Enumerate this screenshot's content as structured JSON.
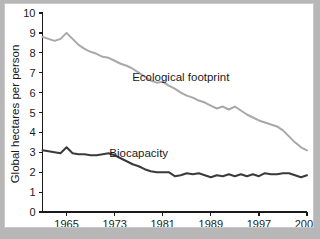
{
  "card": {
    "background_color": "#ffffff",
    "border_color": "#c9c9c9",
    "page_background_color": "#b7b7b7"
  },
  "chart_data": {
    "type": "line",
    "title": "",
    "subtitle": "",
    "xlabel": "",
    "ylabel": "Global hectares per person",
    "xlim": [
      1961,
      2005
    ],
    "ylim": [
      0,
      10
    ],
    "grid": false,
    "legend": "inline-annotation",
    "yticks": [
      0,
      1,
      2,
      3,
      4,
      5,
      6,
      7,
      8,
      9,
      10
    ],
    "ytick_labels": [
      "0",
      "1",
      "2",
      "3",
      "4",
      "5",
      "6",
      "7",
      "8",
      "9",
      "10"
    ],
    "xticks": [
      1965,
      1973,
      1981,
      1989,
      1997,
      2005
    ],
    "xtick_labels": [
      "1965",
      "1973",
      "1981",
      "1989",
      "1997",
      "2005"
    ],
    "x": [
      1961,
      1962,
      1963,
      1964,
      1965,
      1966,
      1967,
      1968,
      1969,
      1970,
      1971,
      1972,
      1973,
      1974,
      1975,
      1976,
      1977,
      1978,
      1979,
      1980,
      1981,
      1982,
      1983,
      1984,
      1985,
      1986,
      1987,
      1988,
      1989,
      1990,
      1991,
      1992,
      1993,
      1994,
      1995,
      1996,
      1997,
      1998,
      1999,
      2000,
      2001,
      2002,
      2003,
      2004,
      2005
    ],
    "series": [
      {
        "name": "Ecological footprint",
        "color": "#a8a8a8",
        "label_x": 1984,
        "label_y": 6.6,
        "values": [
          8.8,
          8.7,
          8.6,
          8.7,
          9.0,
          8.7,
          8.4,
          8.2,
          8.05,
          7.95,
          7.8,
          7.75,
          7.6,
          7.45,
          7.35,
          7.2,
          7.0,
          6.8,
          6.6,
          6.5,
          6.55,
          6.35,
          6.2,
          6.0,
          5.85,
          5.75,
          5.6,
          5.5,
          5.35,
          5.2,
          5.3,
          5.15,
          5.3,
          5.1,
          4.9,
          4.75,
          4.6,
          4.5,
          4.4,
          4.3,
          4.1,
          3.8,
          3.5,
          3.25,
          3.1
        ]
      },
      {
        "name": "Biocapacity",
        "color": "#3a3a3a",
        "label_x": 1977,
        "label_y": 2.75,
        "values": [
          3.1,
          3.05,
          3.0,
          2.95,
          3.25,
          2.95,
          2.9,
          2.9,
          2.85,
          2.85,
          2.9,
          2.95,
          2.85,
          2.7,
          2.55,
          2.4,
          2.3,
          2.15,
          2.05,
          2.0,
          2.0,
          2.0,
          1.8,
          1.85,
          1.95,
          1.9,
          1.95,
          1.85,
          1.75,
          1.85,
          1.8,
          1.9,
          1.8,
          1.9,
          1.8,
          1.9,
          1.8,
          1.95,
          1.9,
          1.9,
          1.95,
          1.95,
          1.85,
          1.75,
          1.85
        ]
      }
    ]
  }
}
